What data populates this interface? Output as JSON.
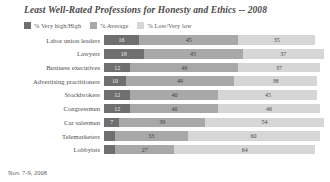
{
  "chart_data": {
    "type": "bar",
    "subtype": "stacked-horizontal-100",
    "title": "Least Well-Rated Professions for Honesty and Ethics -- 2008",
    "footnote": "Nov. 7-9, 2008",
    "xlabel": "",
    "ylabel": "",
    "xlim": [
      0,
      100
    ],
    "grid": false,
    "legend_position": "top-left",
    "categories": [
      "Labor union leaders",
      "Lawyers",
      "Business executives",
      "Advertising practitioners",
      "Stockbrokers",
      "Congressmen",
      "Car salesmen",
      "Telemarketers",
      "Lobbyists"
    ],
    "series": [
      {
        "name": "% Very high/High",
        "color": "#6f6f6f",
        "values": [
          16,
          18,
          12,
          10,
          12,
          12,
          7,
          5,
          5
        ]
      },
      {
        "name": "% Average",
        "color": "#a8a8a8",
        "values": [
          45,
          45,
          49,
          49,
          40,
          40,
          39,
          33,
          27
        ]
      },
      {
        "name": "% Low/Very low",
        "color": "#d6d6d6",
        "values": [
          35,
          37,
          37,
          38,
          45,
          46,
          54,
          60,
          64
        ]
      }
    ],
    "value_labels": {
      "hidden_small_segments": [
        "Telemarketers",
        "Lobbyists"
      ]
    }
  }
}
